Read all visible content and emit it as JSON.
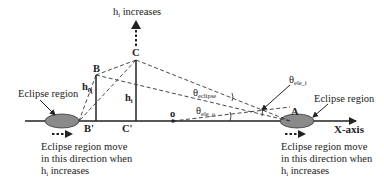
{
  "diagram": {
    "top_label": {
      "base": "h",
      "sub": "i",
      "text": " increases"
    },
    "points": {
      "B": "B",
      "C": "C",
      "B_prime": "B'",
      "C_prime": "C'",
      "o": "o",
      "A": "A"
    },
    "heights": {
      "h_ij": {
        "base": "h",
        "sub": "ij"
      },
      "h_i": {
        "base": "h",
        "sub": "i"
      }
    },
    "angles": {
      "theta_eclipse": {
        "base": "θ",
        "sub": "eclipse"
      },
      "theta_ele_o": {
        "base": "θ",
        "sub": "ele_o"
      },
      "theta_ele_i": {
        "base": "θ",
        "sub": "ele_i"
      }
    },
    "axis_label": "X-axis",
    "left_eclipse_label": "Eclipse region",
    "right_eclipse_label": "Eclipse region",
    "left_move_note": {
      "line1": "Eclipse region move",
      "line2": "in this direction when",
      "line3_base": "h",
      "line3_sub": "i",
      "line3_text": " increases"
    },
    "right_move_note": {
      "line1": "Eclipse region move",
      "line2": "in this direction when",
      "line3_base": "h",
      "line3_sub": "i",
      "line3_text": " increases"
    },
    "colors": {
      "ellipse_fill": "#8a8a8a",
      "line": "#222222"
    }
  }
}
